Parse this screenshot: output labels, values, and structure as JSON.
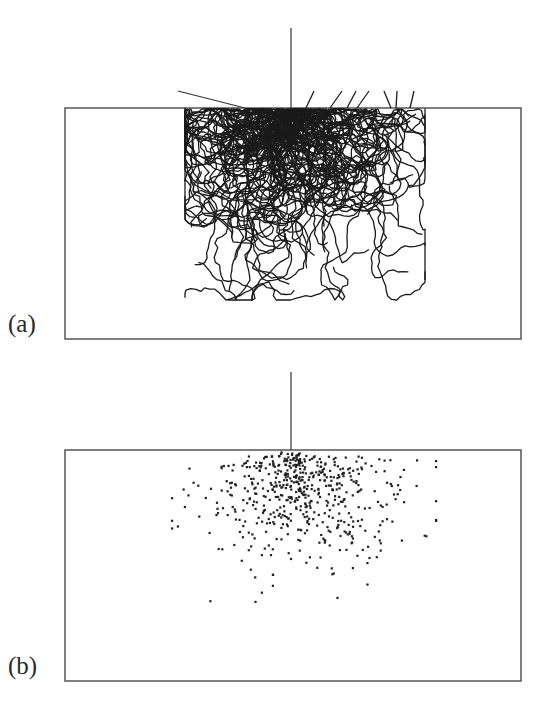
{
  "figure": {
    "panels": [
      {
        "id": "a",
        "label": "(a)",
        "description": "Trajectories of random walks entering a slab from a normally incident beam",
        "box": {
          "x": 65,
          "y": 108,
          "width": 456,
          "height": 231
        },
        "beam": {
          "x": 291,
          "y_top": 28,
          "y_bottom": 108
        },
        "stray_line": {
          "x1": 178,
          "y1": 91,
          "x2": 245,
          "y2": 108
        },
        "entry_x": 291,
        "walk_count": 110,
        "steps_per_walk": 70,
        "step_length": 5.2,
        "escaped_paths": [
          {
            "x1": 314,
            "y1": 91,
            "x2": 306,
            "y2": 108
          },
          {
            "x1": 342,
            "y1": 91,
            "x2": 330,
            "y2": 108
          },
          {
            "x1": 356,
            "y1": 91,
            "x2": 347,
            "y2": 108
          },
          {
            "x1": 369,
            "y1": 91,
            "x2": 357,
            "y2": 108
          },
          {
            "x1": 384,
            "y1": 91,
            "x2": 391,
            "y2": 108
          },
          {
            "x1": 397,
            "y1": 91,
            "x2": 396,
            "y2": 108
          },
          {
            "x1": 414,
            "y1": 91,
            "x2": 410,
            "y2": 108
          }
        ],
        "seed": 7,
        "stroke_color": "#1a1a1a",
        "box_color": "#555555"
      },
      {
        "id": "b",
        "label": "(b)",
        "description": "Scatter of absorption/end points of the random walks",
        "box": {
          "x": 65,
          "y": 90,
          "width": 456,
          "height": 231
        },
        "beam": {
          "x": 291,
          "y_top": 12,
          "y_bottom": 90
        },
        "entry_x": 291,
        "point_count": 560,
        "seed": 11,
        "dot_color": "#222222",
        "box_color": "#555555"
      }
    ]
  },
  "chart_data": {
    "type": "scatter",
    "title": "",
    "panels": [
      {
        "label": "(a)",
        "kind": "trajectories",
        "walks": 110,
        "source_x_fraction": 0.496,
        "extent_x_fraction": [
          0.26,
          0.8
        ],
        "extent_y_fraction": [
          0.0,
          0.82
        ]
      },
      {
        "label": "(b)",
        "kind": "end-point scatter",
        "points": 560,
        "source_x_fraction": 0.496,
        "extent_x_fraction": [
          0.24,
          0.82
        ],
        "extent_y_fraction": [
          0.0,
          0.72
        ]
      }
    ],
    "xlabel": "",
    "ylabel": ""
  }
}
